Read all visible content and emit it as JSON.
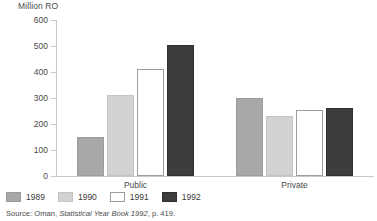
{
  "chart_data": {
    "type": "bar",
    "title": "",
    "subtitle": "",
    "xlabel": "",
    "ylabel": "Million RO",
    "ylim": [
      0,
      600
    ],
    "ytick_step": 100,
    "yticks": [
      "600",
      "500",
      "400",
      "300",
      "200",
      "100",
      "0"
    ],
    "ytick_values": [
      600,
      500,
      400,
      300,
      200,
      100,
      0
    ],
    "grid": false,
    "legend_position": "bottom-left",
    "categories": [
      "Public",
      "Private"
    ],
    "series": [
      {
        "name": "1989",
        "values": [
          150,
          300
        ],
        "color": "#a8a8a8"
      },
      {
        "name": "1990",
        "values": [
          312,
          230
        ],
        "color": "#d2d2d2"
      },
      {
        "name": "1991",
        "values": [
          412,
          255
        ],
        "color": "#ffffff"
      },
      {
        "name": "1992",
        "values": [
          505,
          262
        ],
        "color": "#3d3d3d"
      }
    ],
    "source": "Source: Oman, Statistical Year Book 1992, p. 419."
  },
  "axis": {
    "unit_label": "Million RO"
  },
  "legend": {
    "items": [
      {
        "label": "1989"
      },
      {
        "label": "1990"
      },
      {
        "label": "1991"
      },
      {
        "label": "1992"
      }
    ]
  },
  "footer": {
    "source_prefix": "Source: Oman, ",
    "source_italic": "Statistical Year Book 1992",
    "source_suffix": ", p. 419."
  }
}
